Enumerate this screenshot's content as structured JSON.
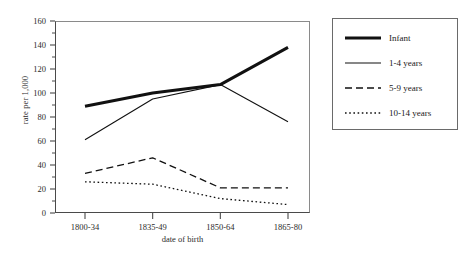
{
  "chart_data": {
    "type": "line",
    "title": "",
    "xlabel": "date of birth",
    "ylabel": "rate per 1,000",
    "categories": [
      "1800-34",
      "1835-49",
      "1850-64",
      "1865-80"
    ],
    "ylim": [
      0,
      160
    ],
    "ytick_labels": [
      "0",
      "20",
      "40",
      "60",
      "80",
      "100",
      "120",
      "140",
      "160"
    ],
    "ytick_values": [
      0,
      20,
      40,
      60,
      80,
      100,
      120,
      140,
      160
    ],
    "grid": false,
    "legend_position": "right-outside",
    "series": [
      {
        "name": "Infant",
        "style": "solid-thick",
        "values": [
          89,
          100,
          107,
          138
        ]
      },
      {
        "name": "1-4 years",
        "style": "solid-thin",
        "values": [
          61,
          95,
          107,
          76
        ]
      },
      {
        "name": "5-9 years",
        "style": "dashed",
        "values": [
          33,
          46,
          21,
          21
        ]
      },
      {
        "name": "10-14 years",
        "style": "dotted",
        "values": [
          26,
          24,
          12,
          7
        ]
      }
    ]
  },
  "legend": {
    "items": [
      {
        "label": "Infant"
      },
      {
        "label": "1-4 years"
      },
      {
        "label": "5-9 years"
      },
      {
        "label": "10-14 years"
      }
    ]
  },
  "axes": {
    "y_title": "rate per 1,000",
    "x_title": "date of birth"
  }
}
